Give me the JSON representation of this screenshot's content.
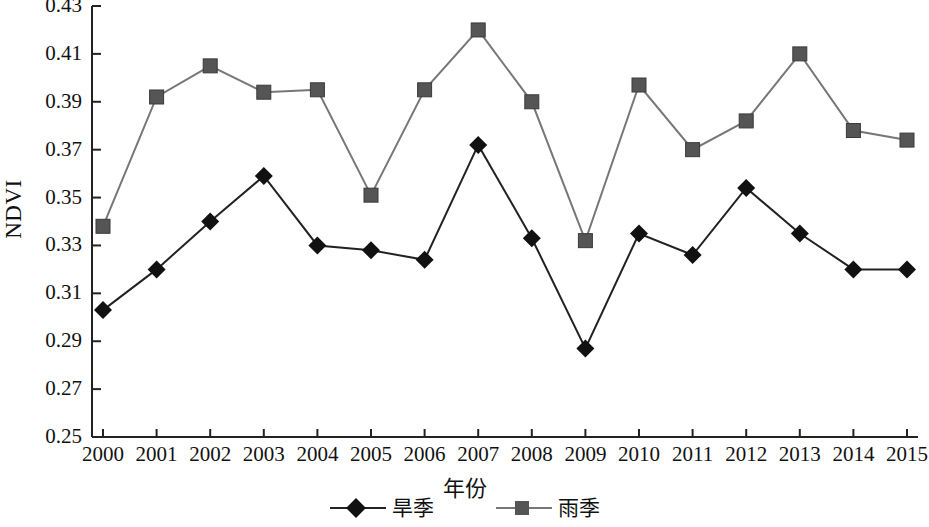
{
  "chart_data": {
    "type": "line",
    "title": "",
    "xlabel": "年份",
    "ylabel": "NDVI",
    "categories": [
      "2000",
      "2001",
      "2002",
      "2003",
      "2004",
      "2005",
      "2006",
      "2007",
      "2008",
      "2009",
      "2010",
      "2011",
      "2012",
      "2013",
      "2014",
      "2015"
    ],
    "xlim": [
      2000,
      2015
    ],
    "ylim": [
      0.25,
      0.43
    ],
    "yticks": [
      "0.25",
      "0.27",
      "0.29",
      "0.31",
      "0.33",
      "0.35",
      "0.37",
      "0.39",
      "0.41",
      "0.43"
    ],
    "ytick_values": [
      0.25,
      0.27,
      0.29,
      0.31,
      0.33,
      0.35,
      0.37,
      0.39,
      0.41,
      0.43
    ],
    "grid": false,
    "legend_position": "bottom",
    "series": [
      {
        "name": "旱季",
        "marker": "diamond",
        "color": "#111111",
        "line_color": "#222222",
        "values": [
          0.303,
          0.32,
          0.34,
          0.359,
          0.33,
          0.328,
          0.324,
          0.372,
          0.333,
          0.287,
          0.335,
          0.326,
          0.354,
          0.335,
          0.32,
          0.32
        ]
      },
      {
        "name": "雨季",
        "marker": "square",
        "color": "#555555",
        "line_color": "#777777",
        "values": [
          0.338,
          0.392,
          0.405,
          0.394,
          0.395,
          0.351,
          0.395,
          0.42,
          0.39,
          0.332,
          0.397,
          0.37,
          0.382,
          0.41,
          0.378,
          0.374
        ]
      }
    ]
  },
  "axis": {
    "ylabel": "NDVI",
    "xlabel": "年份"
  },
  "legend": {
    "entries": [
      {
        "label": "旱季"
      },
      {
        "label": "雨季"
      }
    ]
  }
}
